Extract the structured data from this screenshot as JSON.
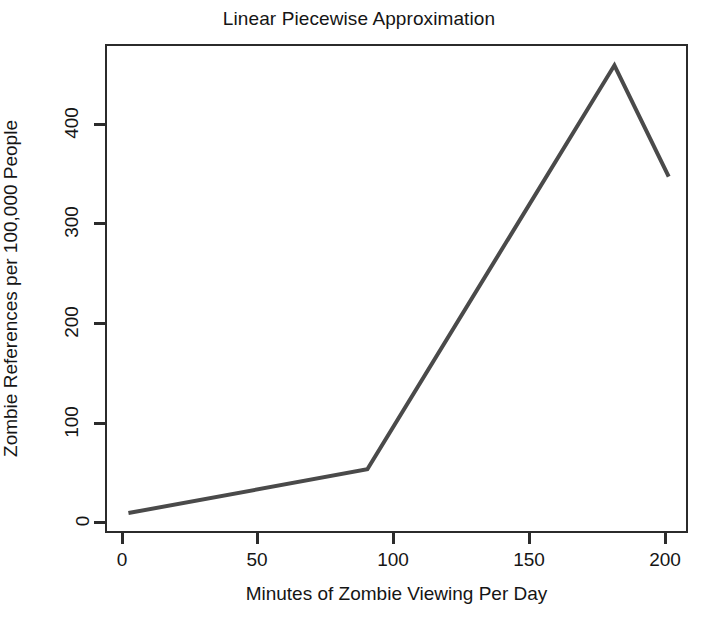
{
  "chart_data": {
    "type": "line",
    "title": "Linear Piecewise Approximation",
    "xlabel": "Minutes of Zombie Viewing Per Day",
    "ylabel": "Zombie References per 100,000 People",
    "x": [
      2,
      90,
      181,
      201
    ],
    "values": [
      10,
      54,
      460,
      348
    ],
    "series": [
      {
        "name": "Zombie references",
        "points": [
          {
            "x": 2,
            "y": 10
          },
          {
            "x": 90,
            "y": 54
          },
          {
            "x": 181,
            "y": 460
          },
          {
            "x": 201,
            "y": 348
          }
        ]
      }
    ],
    "xlim": [
      -5,
      210
    ],
    "ylim": [
      -12,
      495
    ],
    "xticks": [
      0,
      50,
      100,
      150,
      200
    ],
    "yticks": [
      0,
      100,
      200,
      300,
      400
    ],
    "xtick_labels": [
      "0",
      "50",
      "100",
      "150",
      "200"
    ],
    "ytick_labels": [
      "0",
      "100",
      "200",
      "300",
      "400"
    ],
    "grid": false,
    "legend": null,
    "line_color": "#4a4a4a",
    "line_width": 4,
    "axis_color": "#2b2b2b",
    "background": "#ffffff"
  }
}
